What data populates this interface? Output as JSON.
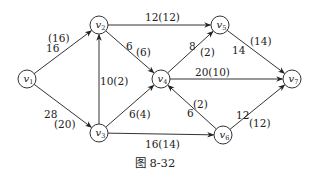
{
  "figure": {
    "caption": "图 8-32",
    "caption_pos": [
      155,
      167
    ]
  },
  "style": {
    "stroke_color": "#333333",
    "node_fill": "#ffffff",
    "node_radius": 9
  },
  "nodes": [
    {
      "id": "v1",
      "name": "v",
      "sub": "1",
      "x": 27,
      "y": 79
    },
    {
      "id": "v2",
      "name": "v",
      "sub": "2",
      "x": 99,
      "y": 25
    },
    {
      "id": "v3",
      "name": "v",
      "sub": "3",
      "x": 99,
      "y": 133
    },
    {
      "id": "v4",
      "name": "v",
      "sub": "4",
      "x": 161,
      "y": 79
    },
    {
      "id": "v5",
      "name": "v",
      "sub": "5",
      "x": 220,
      "y": 25
    },
    {
      "id": "v6",
      "name": "v",
      "sub": "6",
      "x": 223,
      "y": 135
    },
    {
      "id": "v7",
      "name": "v",
      "sub": "7",
      "x": 292,
      "y": 79
    }
  ],
  "edges": [
    {
      "from": "v1",
      "to": "v2",
      "labels": [
        {
          "text": "(16)",
          "x": 48,
          "y": 42
        },
        {
          "text": "16",
          "x": 46,
          "y": 52
        }
      ]
    },
    {
      "from": "v1",
      "to": "v3",
      "labels": [
        {
          "text": "28",
          "x": 44,
          "y": 118
        },
        {
          "text": "(20)",
          "x": 54,
          "y": 128
        }
      ]
    },
    {
      "from": "v3",
      "to": "v2",
      "labels": [
        {
          "text": "10(2)",
          "x": 100,
          "y": 85
        }
      ]
    },
    {
      "from": "v2",
      "to": "v5",
      "labels": [
        {
          "text": "12(12)",
          "x": 145,
          "y": 21
        }
      ]
    },
    {
      "from": "v2",
      "to": "v4",
      "labels": [
        {
          "text": "6",
          "x": 126,
          "y": 50
        },
        {
          "text": "(6)",
          "x": 136,
          "y": 56
        }
      ]
    },
    {
      "from": "v3",
      "to": "v4",
      "labels": [
        {
          "text": "6(4)",
          "x": 129,
          "y": 118
        }
      ]
    },
    {
      "from": "v4",
      "to": "v5",
      "labels": [
        {
          "text": "8",
          "x": 189,
          "y": 50
        },
        {
          "text": "(2)",
          "x": 200,
          "y": 56
        }
      ]
    },
    {
      "from": "v4",
      "to": "v7",
      "labels": [
        {
          "text": "20(10)",
          "x": 195,
          "y": 76
        }
      ]
    },
    {
      "from": "v5",
      "to": "v7",
      "labels": [
        {
          "text": "14",
          "x": 232,
          "y": 54
        },
        {
          "text": "(14)",
          "x": 250,
          "y": 45
        }
      ]
    },
    {
      "from": "v3",
      "to": "v6",
      "labels": [
        {
          "text": "16(14)",
          "x": 145,
          "y": 148
        }
      ]
    },
    {
      "from": "v6",
      "to": "v4",
      "labels": [
        {
          "text": "(2)",
          "x": 193,
          "y": 108
        },
        {
          "text": "6",
          "x": 187,
          "y": 117
        }
      ]
    },
    {
      "from": "v6",
      "to": "v7",
      "labels": [
        {
          "text": "12",
          "x": 236,
          "y": 119
        },
        {
          "text": "(12)",
          "x": 249,
          "y": 127
        }
      ]
    }
  ]
}
